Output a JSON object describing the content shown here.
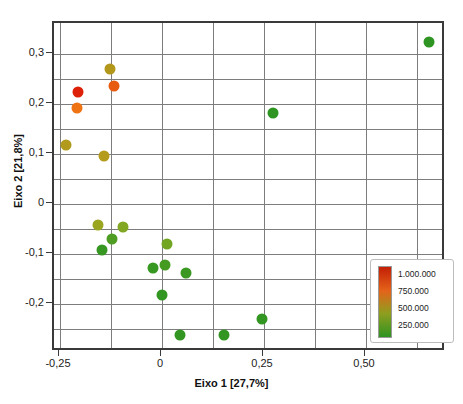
{
  "chart_data": {
    "type": "scatter",
    "title": "",
    "xlabel": "Eixo 1 [27,7%]",
    "ylabel": "Eixo 2 [21,8%]",
    "xlim": [
      -0.28,
      0.68
    ],
    "ylim": [
      -0.28,
      0.36
    ],
    "xticks": [
      "-0,25",
      "0",
      "0,25",
      "0,50"
    ],
    "xtick_values": [
      -0.25,
      0,
      0.25,
      0.5
    ],
    "yticks": [
      "0,3",
      "0,2",
      "0,1",
      "0",
      "-0,1",
      "-0,2"
    ],
    "ytick_values": [
      0.3,
      0.2,
      0.1,
      0,
      -0.1,
      -0.2
    ],
    "grid": true,
    "grid_x_values": [
      -0.25,
      -0.125,
      0,
      0.125,
      0.25,
      0.375,
      0.5,
      0.625
    ],
    "grid_y_values": [
      0.3,
      0.25,
      0.2,
      0.15,
      0.1,
      0.05,
      0,
      -0.05,
      -0.1,
      -0.15,
      -0.2,
      -0.25
    ],
    "colormap": "green-to-red",
    "legend": {
      "position": "bottom-right",
      "type": "colorbar",
      "labels": [
        "1.000.000",
        "750.000",
        "500.000",
        "250.000"
      ],
      "values": [
        1000000,
        750000,
        500000,
        250000
      ],
      "gradient_top_color": "#c41f06",
      "gradient_mid_color": "#e4631a",
      "gradient_low_color": "#8f9e1f",
      "gradient_bottom_color": "#2f9422"
    },
    "points": [
      {
        "x": -0.205,
        "y": 0.225,
        "value": 1000000,
        "color": "#dd2008"
      },
      {
        "x": -0.208,
        "y": 0.193,
        "value": 700000,
        "color": "#ef7312"
      },
      {
        "x": -0.128,
        "y": 0.271,
        "value": 430000,
        "color": "#b2971a"
      },
      {
        "x": -0.118,
        "y": 0.237,
        "value": 780000,
        "color": "#e85c12"
      },
      {
        "x": -0.235,
        "y": 0.119,
        "value": 400000,
        "color": "#b19a1c"
      },
      {
        "x": -0.142,
        "y": 0.096,
        "value": 400000,
        "color": "#b49b1c"
      },
      {
        "x": -0.158,
        "y": -0.042,
        "value": 330000,
        "color": "#9aa520"
      },
      {
        "x": -0.095,
        "y": -0.046,
        "value": 290000,
        "color": "#82a722"
      },
      {
        "x": -0.122,
        "y": -0.069,
        "value": 230000,
        "color": "#4f9d22"
      },
      {
        "x": -0.147,
        "y": -0.092,
        "value": 180000,
        "color": "#379722"
      },
      {
        "x": 0.012,
        "y": -0.08,
        "value": 270000,
        "color": "#72a522"
      },
      {
        "x": -0.022,
        "y": -0.128,
        "value": 190000,
        "color": "#379822"
      },
      {
        "x": 0.008,
        "y": -0.121,
        "value": 210000,
        "color": "#459a22"
      },
      {
        "x": 0.058,
        "y": -0.138,
        "value": 190000,
        "color": "#3b9822"
      },
      {
        "x": 0.0,
        "y": -0.182,
        "value": 170000,
        "color": "#339622"
      },
      {
        "x": 0.043,
        "y": -0.261,
        "value": 170000,
        "color": "#339622"
      },
      {
        "x": 0.152,
        "y": -0.261,
        "value": 170000,
        "color": "#339622"
      },
      {
        "x": 0.245,
        "y": -0.23,
        "value": 170000,
        "color": "#339622"
      },
      {
        "x": 0.272,
        "y": 0.182,
        "value": 170000,
        "color": "#2f9522"
      },
      {
        "x": 0.655,
        "y": 0.324,
        "value": 170000,
        "color": "#2f9522"
      }
    ]
  }
}
